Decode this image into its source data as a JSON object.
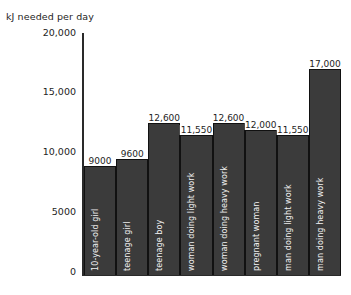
{
  "chart_data": {
    "type": "bar",
    "title": "",
    "ylabel": "kJ needed per day",
    "xlabel": "",
    "ylim": [
      0,
      20000
    ],
    "grid": false,
    "legend": "none",
    "ytick_labels": [
      "20,000",
      "15,000",
      "10,000",
      "5000",
      "0"
    ],
    "ytick_values": [
      20000,
      15000,
      10000,
      5000,
      0
    ],
    "categories": [
      "10-year-old girl",
      "teenage girl",
      "teenage boy",
      "woman doing light work",
      "woman doing heavy work",
      "pregnant woman",
      "man doing light work",
      "man doing heavy work"
    ],
    "values": [
      9000,
      9600,
      12600,
      11550,
      12600,
      12000,
      11550,
      17000
    ],
    "value_labels": [
      "9000",
      "9600",
      "12,600",
      "11,550",
      "12,600",
      "12,000",
      "11,550",
      "17,000"
    ],
    "colors": {
      "bar_fill": "#3b3b3b",
      "bar_edge": "#111111",
      "axis": "#2a2a2a",
      "text": "#1e1e1e",
      "bar_label_text": "#f2f2f2",
      "background": "#ffffff"
    }
  }
}
